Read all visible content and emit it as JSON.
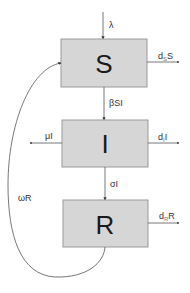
{
  "diagram": {
    "type": "SIR compartmental model",
    "compartments": [
      {
        "id": "S",
        "label": "S"
      },
      {
        "id": "I",
        "label": "I"
      },
      {
        "id": "R",
        "label": "R"
      }
    ],
    "flows": {
      "birth": {
        "label": "λ",
        "from": null,
        "to": "S"
      },
      "infection": {
        "label": "βSI",
        "from": "S",
        "to": "I"
      },
      "recovery": {
        "label": "σI",
        "from": "I",
        "to": "R"
      },
      "waning": {
        "label": "ωR",
        "from": "R",
        "to": "S"
      },
      "disease_death": {
        "label": "μI",
        "from": "I",
        "to": null
      },
      "death_S": {
        "label_main": "d",
        "label_sub": "S",
        "label_tail": "S",
        "from": "S",
        "to": null
      },
      "death_I": {
        "label_main": "d",
        "label_sub": "I",
        "label_tail": "I",
        "from": "I",
        "to": null
      },
      "death_R": {
        "label_main": "d",
        "label_sub": "R",
        "label_tail": "R",
        "from": "R",
        "to": null
      }
    },
    "colors": {
      "box_fill": "#d6d6d6",
      "box_stroke": "#9a9a9a",
      "line": "#555555",
      "text": "#1a1a1a"
    }
  }
}
